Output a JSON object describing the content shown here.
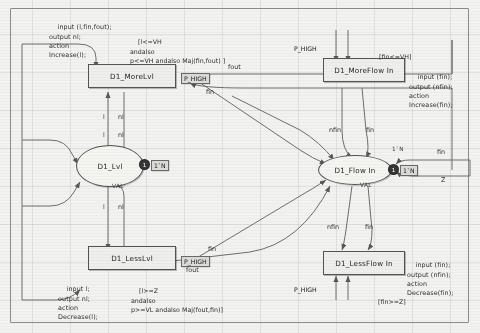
{
  "diagram": {
    "colors": {
      "ink": "#333333",
      "node_fill": "#e9e9e7",
      "frame": "#8d8d8d",
      "token": "#3a3a3a"
    }
  },
  "transitions": [
    {
      "id": "t_morelvl",
      "label": "D1_MoreLvl"
    },
    {
      "id": "t_lesslvl",
      "label": "D1_LessLvl"
    },
    {
      "id": "t_moreflow",
      "label": "D1_MoreFlow In"
    },
    {
      "id": "t_lessflow",
      "label": "D1_LessFlow In"
    }
  ],
  "places": [
    {
      "id": "p_lvl",
      "label": "D1_Lvl",
      "marking": "1`N",
      "count": "1",
      "colorset": "VAL"
    },
    {
      "id": "p_flowin",
      "label": "D1_Flow In",
      "marking": "1`N",
      "count": "1",
      "colorset": "VAL"
    }
  ],
  "code_blocks": [
    {
      "id": "code_morelvl",
      "text": "input (l,fin,fout);\noutput nl;\naction\nIncrease(l);"
    },
    {
      "id": "code_lesslvl",
      "text": "input l;\noutput nl;\naction\nDecrease(l);"
    },
    {
      "id": "code_moreflow",
      "text": "input (fin);\noutput (nfin);\naction\nIncrease(fin);"
    },
    {
      "id": "code_lessflow",
      "text": "input (fin);\noutput (nfin);\naction\nDecrease(fin);"
    }
  ],
  "guards": [
    {
      "id": "g_morelvl",
      "text": "[l<=VH\nandalso\np<=VH andalso Maj(fin,fout) ]"
    },
    {
      "id": "g_lesslvl",
      "text": "[l>=Z\nandalso\np>=VL andalso Maj(fout,fin)]"
    },
    {
      "id": "g_moreflow",
      "text": "[fin<=VH]"
    },
    {
      "id": "g_lessflow",
      "text": "[fin>=Z]"
    }
  ],
  "ports": [
    {
      "id": "port_morelvl",
      "label": "P_HIGH"
    },
    {
      "id": "port_lesslvl",
      "label": "P_HIGH"
    },
    {
      "id": "port_moreflow",
      "label": "P_HIGH"
    },
    {
      "id": "port_lessflow",
      "label": "P_HIGH"
    }
  ],
  "arc_labels": [
    {
      "id": "a1",
      "text": "fout"
    },
    {
      "id": "a2",
      "text": "fin"
    },
    {
      "id": "a3",
      "text": "l"
    },
    {
      "id": "a4",
      "text": "nl"
    },
    {
      "id": "a5",
      "text": "l"
    },
    {
      "id": "a6",
      "text": "nl"
    },
    {
      "id": "a7",
      "text": "l"
    },
    {
      "id": "a8",
      "text": "nl"
    },
    {
      "id": "a9",
      "text": "fin"
    },
    {
      "id": "a10",
      "text": "nfin"
    },
    {
      "id": "a11",
      "text": "fin"
    },
    {
      "id": "a12",
      "text": "nfin"
    },
    {
      "id": "a13",
      "text": "fin"
    },
    {
      "id": "a14",
      "text": "fout"
    },
    {
      "id": "a15",
      "text": "fin"
    },
    {
      "id": "a16",
      "text": "Z"
    },
    {
      "id": "a17",
      "text": "1`N"
    }
  ]
}
